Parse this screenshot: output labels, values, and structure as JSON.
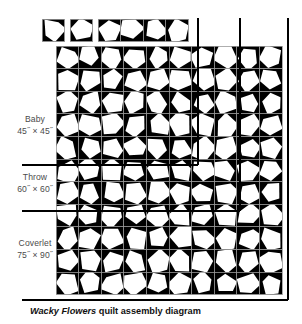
{
  "diagram": {
    "caption_emphasis": "Wacky Flowers",
    "caption_rest": " quilt assembly diagram",
    "colors": {
      "background": "#ffffff",
      "block_background": "#000000",
      "flower_fill": "#ffffff",
      "grid_line": "#9a9a9a",
      "size_rule": "#000000",
      "label_text": "#4b4b4b",
      "caption_text": "#111111"
    },
    "sizes": [
      {
        "name": "Baby",
        "dims": "45˝ × 45˝"
      },
      {
        "name": "Throw",
        "dims": "60˝ × 60˝"
      },
      {
        "name": "Coverlet",
        "dims": "75˝ × 90˝"
      }
    ],
    "grid": {
      "columns": 10,
      "rows": 11,
      "cell_size": 22.6,
      "origin_x": 56,
      "origin_y": 46
    },
    "size_rules": {
      "baby": {
        "columns": 6,
        "rows": 5,
        "x": 198,
        "y": 165
      },
      "throw": {
        "columns": 8,
        "rows": 7,
        "x": 240,
        "y": 211
      },
      "coverlet": {
        "columns": 10,
        "rows": 11,
        "x": 288,
        "y": 300
      }
    },
    "legend_blocks": {
      "single_1": {
        "x": 42,
        "y": 19,
        "cells": 1
      },
      "single_2": {
        "x": 70,
        "y": 19,
        "cells": 1
      },
      "strip_4": {
        "x": 98,
        "y": 19,
        "cells": 4
      },
      "row_bar": {
        "x": 56,
        "y": 44,
        "cells": 10
      }
    }
  },
  "chart_data": {
    "type": "table",
    "title": "Wacky Flowers quilt assembly diagram",
    "categories": [
      "Baby",
      "Throw",
      "Coverlet"
    ],
    "series": [
      {
        "name": "blocks_across",
        "values": [
          6,
          8,
          10
        ]
      },
      {
        "name": "blocks_down",
        "values": [
          5,
          7,
          11
        ]
      }
    ],
    "annotations": [
      "45˝ × 45˝",
      "60˝ × 60˝",
      "75˝ × 90˝"
    ]
  }
}
